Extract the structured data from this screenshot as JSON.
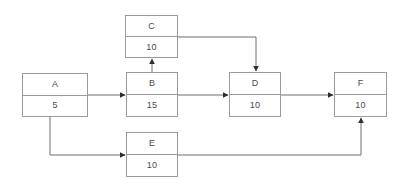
{
  "diagram": {
    "type": "activity-on-node-network",
    "background_color": "#ffffff",
    "line_color": "#6e6e6e",
    "border_color": "#9a9a9a",
    "text_color": "#4a4a4a",
    "nodes": [
      {
        "id": "A",
        "label": "A",
        "duration": "5",
        "x": 22,
        "y": 73,
        "w": 66,
        "h": 44
      },
      {
        "id": "B",
        "label": "B",
        "duration": "15",
        "x": 126,
        "y": 72,
        "w": 52,
        "h": 45
      },
      {
        "id": "C",
        "label": "C",
        "duration": "10",
        "x": 125,
        "y": 15,
        "w": 53,
        "h": 43
      },
      {
        "id": "D",
        "label": "D",
        "duration": "10",
        "x": 229,
        "y": 72,
        "w": 52,
        "h": 45
      },
      {
        "id": "E",
        "label": "E",
        "duration": "10",
        "x": 126,
        "y": 132,
        "w": 52,
        "h": 45
      },
      {
        "id": "F",
        "label": "F",
        "duration": "10",
        "x": 334,
        "y": 72,
        "w": 53,
        "h": 45
      }
    ],
    "edges": [
      {
        "from": "A",
        "to": "B",
        "shape": "straight-horizontal"
      },
      {
        "from": "B",
        "to": "C",
        "shape": "straight-vertical-up"
      },
      {
        "from": "B",
        "to": "D",
        "shape": "straight-horizontal"
      },
      {
        "from": "C",
        "to": "D",
        "shape": "elbow-right-down"
      },
      {
        "from": "D",
        "to": "F",
        "shape": "straight-horizontal"
      },
      {
        "from": "A",
        "to": "E",
        "shape": "elbow-down-right"
      },
      {
        "from": "E",
        "to": "F",
        "shape": "elbow-right-up"
      }
    ]
  }
}
